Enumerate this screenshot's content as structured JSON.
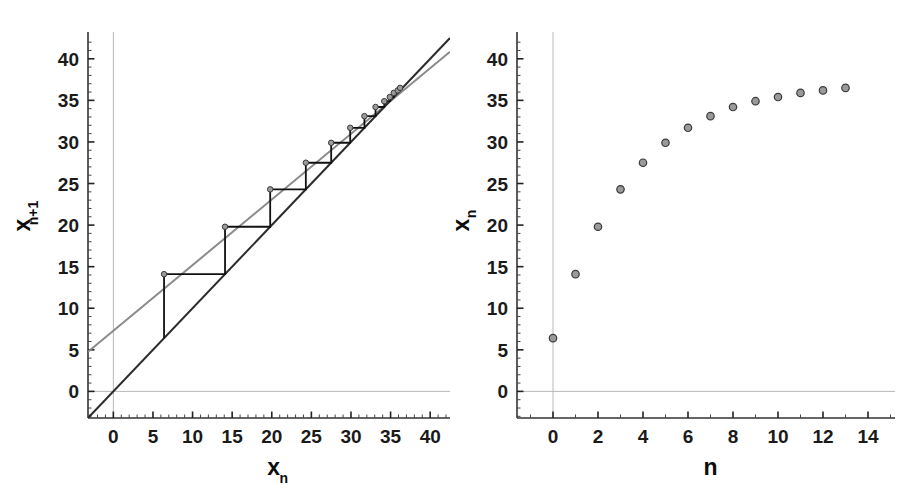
{
  "figure": {
    "background": "#ffffff",
    "panels": [
      "cobweb-diagram",
      "time-series-plot"
    ]
  },
  "chart_data": [
    {
      "type": "line",
      "name": "cobweb-diagram",
      "title": "",
      "xlabel": "x",
      "xlabel_sub": "n",
      "ylabel": "x",
      "ylabel_sub": "n+1",
      "xlim": [
        -3.2,
        42.5
      ],
      "ylim": [
        -3.2,
        42.5
      ],
      "xticks": [
        0,
        5,
        10,
        15,
        20,
        25,
        30,
        35,
        40
      ],
      "yticks": [
        0,
        5,
        10,
        15,
        20,
        25,
        30,
        35,
        40
      ],
      "xticklabels": [
        "0",
        "5",
        "10",
        "15",
        "20",
        "25",
        "30",
        "35",
        "40"
      ],
      "yticklabels": [
        "0",
        "5",
        "10",
        "15",
        "20",
        "25",
        "30",
        "35",
        "40"
      ],
      "minor_tick_step": 1,
      "grid": false,
      "zero_gridlines": true,
      "zero_gridline_color": "#b8b8b8",
      "series": [
        {
          "name": "map-line",
          "label": "x_{n+1} = a*x_n + b",
          "type": "line",
          "color": "#8a8a8a",
          "linewidth": 2,
          "slope": 0.7895,
          "intercept": 7.3,
          "x": [
            -3.2,
            42.5
          ],
          "values": [
            4.77,
            40.84
          ]
        },
        {
          "name": "identity-line",
          "label": "x_{n+1} = x_n",
          "type": "line",
          "color": "#2b2b2b",
          "linewidth": 2,
          "slope": 1,
          "intercept": 0,
          "x": [
            -3.2,
            42.5
          ],
          "values": [
            -3.2,
            42.5
          ]
        },
        {
          "name": "cobweb-path",
          "label": "iteration staircase",
          "type": "line",
          "color": "#111111",
          "linewidth": 2,
          "orbit": [
            6.4,
            14.1,
            19.8,
            24.3,
            27.5,
            29.9,
            31.7,
            33.1,
            34.2,
            34.9,
            35.4,
            35.9,
            36.2,
            36.5
          ]
        },
        {
          "name": "cobweb-markers",
          "label": "orbit points on map",
          "type": "scatter",
          "marker_face": "#9a9a9a",
          "marker_edge": "#3a3a3a",
          "marker_size": 5,
          "x": [
            6.4,
            14.1,
            19.8,
            24.3,
            27.5,
            29.9,
            31.7,
            33.1,
            34.2,
            34.9,
            35.4,
            35.9,
            36.2
          ],
          "values": [
            14.1,
            19.8,
            24.3,
            27.5,
            29.9,
            31.7,
            33.1,
            34.2,
            34.9,
            35.4,
            35.9,
            36.2,
            36.5
          ]
        }
      ]
    },
    {
      "type": "scatter",
      "name": "time-series-plot",
      "title": "",
      "xlabel": "n",
      "xlabel_sub": "",
      "ylabel": "x",
      "ylabel_sub": "n",
      "xlim": [
        -1.6,
        15.2
      ],
      "ylim": [
        -3.2,
        42.5
      ],
      "xticks": [
        0,
        2,
        4,
        6,
        8,
        10,
        12,
        14
      ],
      "yticks": [
        0,
        5,
        10,
        15,
        20,
        25,
        30,
        35,
        40
      ],
      "xticklabels": [
        "0",
        "2",
        "4",
        "6",
        "8",
        "10",
        "12",
        "14"
      ],
      "yticklabels": [
        "0",
        "5",
        "10",
        "15",
        "20",
        "25",
        "30",
        "35",
        "40"
      ],
      "minor_tick_step_x": 1,
      "minor_tick_step_y": 1,
      "grid": false,
      "zero_gridlines": true,
      "zero_gridline_color": "#b8b8b8",
      "marker_face": "#9a9a9a",
      "marker_edge": "#3a3a3a",
      "marker_size": 6,
      "x": [
        0,
        1,
        2,
        3,
        4,
        5,
        6,
        7,
        8,
        9,
        10,
        11,
        12,
        13
      ],
      "values": [
        6.4,
        14.1,
        19.8,
        24.3,
        27.5,
        29.9,
        31.7,
        33.1,
        34.2,
        34.9,
        35.4,
        35.9,
        36.2,
        36.5
      ]
    }
  ]
}
